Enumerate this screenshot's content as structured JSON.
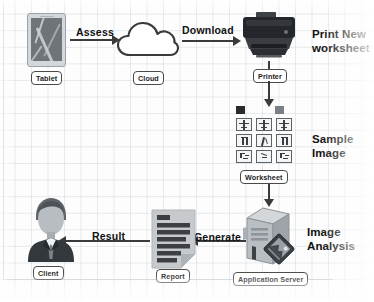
{
  "diagram": {
    "background_color": "#fdfdfd",
    "grid_color": "#c5ccd4",
    "stroke_color": "#3a3a3a",
    "text_color": "#111111"
  },
  "nodes": [
    {
      "id": "tablet",
      "tag": "Tablet",
      "caption": ""
    },
    {
      "id": "cloud",
      "tag": "Cloud",
      "caption": ""
    },
    {
      "id": "printer",
      "tag": "Printer",
      "caption": "Print New\nworksheet"
    },
    {
      "id": "worksheet",
      "tag": "Worksheet",
      "caption": "Sample\nImage"
    },
    {
      "id": "server",
      "tag": "Application Server",
      "caption": "Image\nAnalysis"
    },
    {
      "id": "report",
      "tag": "Report",
      "caption": ""
    },
    {
      "id": "client",
      "tag": "Client",
      "caption": ""
    }
  ],
  "edges": [
    {
      "id": "tablet-to-cloud",
      "label": "Assess",
      "direction": "right"
    },
    {
      "id": "cloud-to-printer",
      "label": "Download",
      "direction": "right"
    },
    {
      "id": "printer-to-worksheet",
      "label": "",
      "direction": "down"
    },
    {
      "id": "worksheet-to-server",
      "label": "",
      "direction": "down"
    },
    {
      "id": "server-to-report",
      "label": "Generate",
      "direction": "left"
    },
    {
      "id": "report-to-client",
      "label": "Result",
      "direction": "left"
    }
  ],
  "worksheet_grid": {
    "rows": 3,
    "cols": 3,
    "top_icons": 2
  }
}
